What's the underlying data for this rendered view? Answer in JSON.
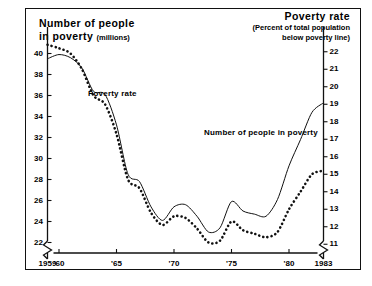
{
  "figure": {
    "title_left": {
      "line1": "Number of people",
      "line2": "in poverty",
      "units": "(millions)"
    },
    "title_right": {
      "line1": "Poverty rate",
      "line2": "(Percent of total population",
      "line3": "below poverty line)"
    }
  },
  "series_labels": {
    "poverty_rate": "Poverty rate",
    "number_in_poverty": "Number of people in poverty"
  },
  "chart_data": {
    "type": "line",
    "xlabel": "",
    "ylabel": "Number of people in poverty (millions)",
    "y2label": "Poverty rate (Percent of total population below poverty line)",
    "grid": false,
    "legend": "inline-annotation",
    "xlim": [
      1959,
      1983
    ],
    "ylim": [
      21,
      41
    ],
    "y2lim": [
      10.5,
      22.5
    ],
    "axis_break_left": true,
    "axis_break_right": true,
    "xticks": [
      1959,
      1960,
      1965,
      1970,
      1975,
      1980,
      1983
    ],
    "xticklabels": [
      "1959",
      "'60",
      "'65",
      "'70",
      "'75",
      "'80",
      "1983"
    ],
    "yticks": [
      22,
      24,
      26,
      28,
      30,
      32,
      34,
      36,
      38,
      40
    ],
    "yticklabels": [
      "22",
      "24",
      "26",
      "28",
      "30",
      "32",
      "34",
      "36",
      "38",
      "40"
    ],
    "y2ticks": [
      11,
      12,
      13,
      14,
      15,
      16,
      17,
      18,
      19,
      20,
      21,
      22
    ],
    "y2ticklabels": [
      "11",
      "12",
      "13",
      "14",
      "15",
      "16",
      "17",
      "18",
      "19",
      "20",
      "21",
      "22"
    ],
    "x": [
      1959,
      1960,
      1961,
      1962,
      1963,
      1964,
      1965,
      1966,
      1967,
      1968,
      1969,
      1970,
      1971,
      1972,
      1973,
      1974,
      1975,
      1976,
      1977,
      1978,
      1979,
      1980,
      1981,
      1982,
      1983
    ],
    "series": [
      {
        "name": "Poverty rate",
        "axis": "right",
        "style": "dotted",
        "unit": "percent",
        "values": [
          22.4,
          22.2,
          21.9,
          21.0,
          19.5,
          19.0,
          17.3,
          14.7,
          14.2,
          12.8,
          12.1,
          12.6,
          12.5,
          11.9,
          11.1,
          11.2,
          12.3,
          11.8,
          11.6,
          11.4,
          11.7,
          13.0,
          14.0,
          15.0,
          15.2
        ]
      },
      {
        "name": "Number of people in poverty",
        "axis": "left",
        "style": "thin-line",
        "unit": "millions",
        "values": [
          39.5,
          39.9,
          39.6,
          38.6,
          36.4,
          36.1,
          33.2,
          28.5,
          27.8,
          25.4,
          24.1,
          25.4,
          25.6,
          24.5,
          23.0,
          23.4,
          25.9,
          25.0,
          24.7,
          24.5,
          26.1,
          29.3,
          31.8,
          34.4,
          35.3
        ]
      }
    ]
  }
}
